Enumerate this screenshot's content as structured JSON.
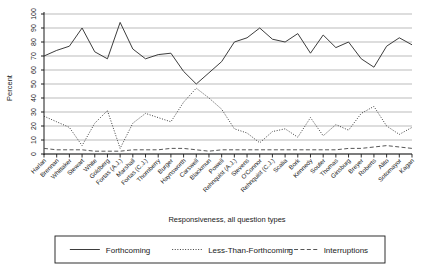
{
  "chart_data": {
    "type": "line",
    "title": "",
    "xlabel": "Responsiveness, all question types",
    "ylabel": "Percent",
    "ylim": [
      0,
      100
    ],
    "yticks": [
      0,
      10,
      20,
      30,
      40,
      50,
      60,
      70,
      80,
      90,
      100
    ],
    "grid": true,
    "legend_position": "bottom",
    "categories": [
      "Harlan",
      "Brennan",
      "Whittaker",
      "Stewart",
      "White",
      "Goldberg",
      "Fortas (A.J.)",
      "Marshall",
      "Fortas (C.J.)",
      "Thornberry",
      "Burger",
      "Haynsworth",
      "Carswell",
      "Blackmun",
      "Powell",
      "Rehnquist (A.J.)",
      "Stevens",
      "O'Connor",
      "Rehnquist (C.J.)",
      "Scalia",
      "Bork",
      "Kennedy",
      "Souter",
      "Thomas",
      "Ginsburg",
      "Breyer",
      "Roberts",
      "Alito",
      "Sotomayor",
      "Kagan"
    ],
    "series": [
      {
        "name": "Forthcoming",
        "style": "solid",
        "color": "#333333",
        "values": [
          70,
          74,
          77,
          90,
          73,
          68,
          94,
          75,
          68,
          71,
          72,
          59,
          50,
          58,
          66,
          80,
          83,
          90,
          82,
          80,
          86,
          72,
          85,
          76,
          80,
          68,
          62,
          77,
          83,
          78
        ]
      },
      {
        "name": "Less-Than-Forthcoming",
        "style": "dotted",
        "color": "#333333",
        "values": [
          27,
          23,
          19,
          6,
          22,
          31,
          4,
          22,
          29,
          26,
          23,
          37,
          47,
          40,
          32,
          18,
          15,
          8,
          16,
          18,
          12,
          26,
          13,
          21,
          17,
          29,
          34,
          20,
          14,
          19
        ]
      },
      {
        "name": "Interruptions",
        "style": "dashed",
        "color": "#4d4d4d",
        "values": [
          4,
          3,
          3,
          3,
          2,
          2,
          2,
          3,
          3,
          3,
          4,
          4,
          3,
          2,
          3,
          3,
          3,
          3,
          3,
          3,
          3,
          3,
          3,
          3,
          4,
          4,
          5,
          6,
          5,
          4
        ]
      }
    ]
  },
  "legend": {
    "items": [
      {
        "label": "Forthcoming",
        "style": "solid"
      },
      {
        "label": "Less-Than-Forthcoming",
        "style": "dotted"
      },
      {
        "label": "Interruptions",
        "style": "dashed"
      }
    ]
  },
  "colors": {
    "grid": "#b3b3b3",
    "axis": "#1a1a1a",
    "series": "#333333",
    "background": "#ffffff"
  }
}
